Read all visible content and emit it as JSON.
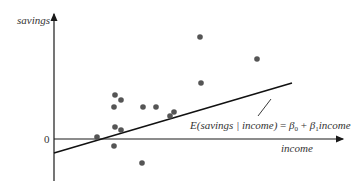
{
  "diagram": {
    "y_axis_label": "savings",
    "x_axis_label": "income",
    "origin_label": "0",
    "equation": {
      "lhs": "E(savings | income)",
      "equals": " = ",
      "beta0": "β",
      "beta0_sub": "0",
      "plus": " + ",
      "beta1": "β",
      "beta1_sub": "1",
      "var": "income"
    },
    "colors": {
      "axis": "#1a1a1a",
      "line": "#111111",
      "points": "#555555",
      "text": "#333333"
    },
    "points_px": [
      [
        97,
        137
      ],
      [
        115,
        95
      ],
      [
        121,
        100
      ],
      [
        114,
        107
      ],
      [
        115,
        127
      ],
      [
        121,
        130
      ],
      [
        114,
        146
      ],
      [
        143,
        107
      ],
      [
        156,
        107
      ],
      [
        142,
        163
      ],
      [
        170,
        116
      ],
      [
        174,
        112
      ],
      [
        200,
        37
      ],
      [
        201,
        83
      ],
      [
        257,
        59
      ]
    ],
    "regression_line_px": [
      [
        54,
        153
      ],
      [
        292,
        83
      ]
    ]
  }
}
